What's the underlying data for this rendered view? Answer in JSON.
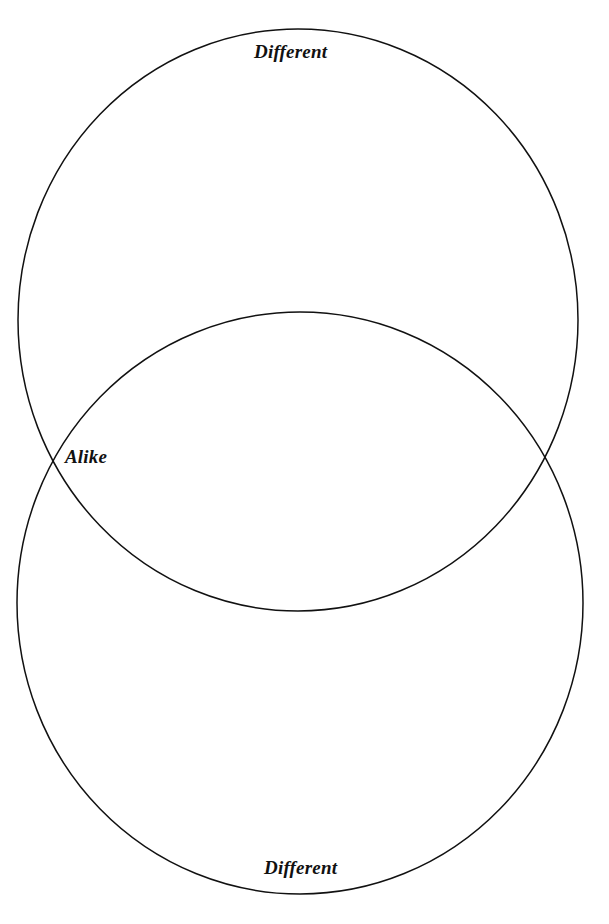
{
  "page": {
    "background_color": "#ffffff",
    "width": 609,
    "height": 924
  },
  "diagram": {
    "type": "venn",
    "set_count": 2,
    "orientation": "vertical",
    "stroke_color": "#111111",
    "stroke_width": 1.5,
    "fill_color": "none",
    "shapes": [
      {
        "name": "upper-circle",
        "cx": 298,
        "cy": 320,
        "rx": 280,
        "ry": 291
      },
      {
        "name": "lower-circle",
        "cx": 300,
        "cy": 603,
        "rx": 283,
        "ry": 291
      }
    ],
    "intersections": [
      {
        "name": "left-intersection",
        "x": 60,
        "y": 456
      },
      {
        "name": "right-intersection",
        "x": 541,
        "y": 460
      }
    ]
  },
  "labels": {
    "top_different": "Different",
    "alike": "Alike",
    "bottom_different": "Different"
  }
}
